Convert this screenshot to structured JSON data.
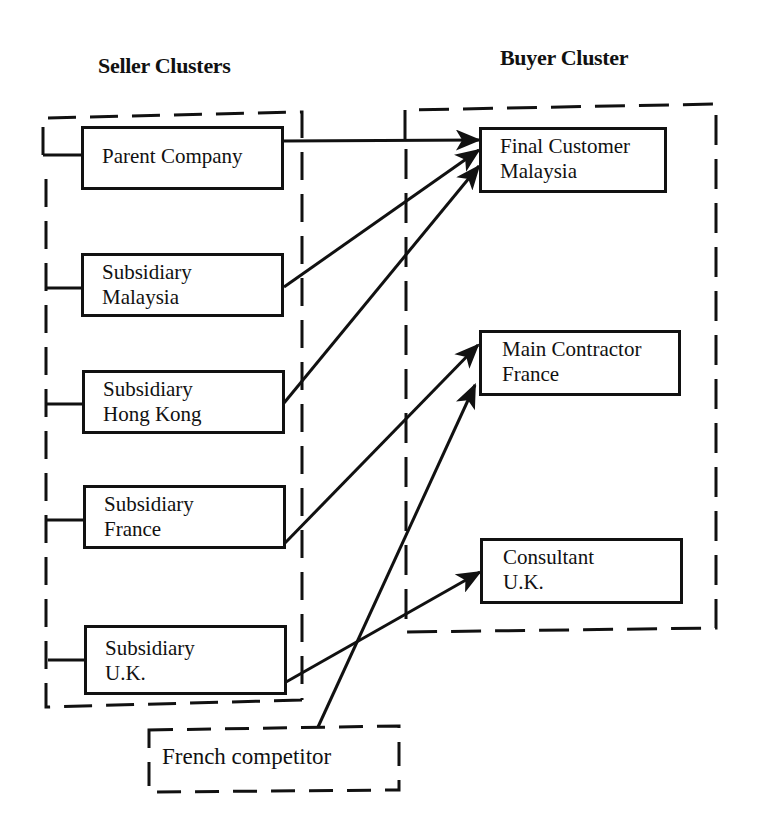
{
  "diagram": {
    "headings": {
      "seller": "Seller Clusters",
      "buyer": "Buyer Cluster"
    },
    "seller_nodes": [
      {
        "id": "parent",
        "lines": [
          "Parent Company"
        ]
      },
      {
        "id": "sub_my",
        "lines": [
          "Subsidiary",
          "Malaysia"
        ]
      },
      {
        "id": "sub_hk",
        "lines": [
          "Subsidiary",
          "Hong Kong"
        ]
      },
      {
        "id": "sub_fr",
        "lines": [
          "Subsidiary",
          "France"
        ]
      },
      {
        "id": "sub_uk",
        "lines": [
          "Subsidiary",
          "U.K."
        ]
      }
    ],
    "buyer_nodes": [
      {
        "id": "final_my",
        "lines": [
          "Final Customer",
          "Malaysia"
        ]
      },
      {
        "id": "main_fr",
        "lines": [
          "Main Contractor",
          "France"
        ]
      },
      {
        "id": "cons_uk",
        "lines": [
          "Consultant",
          "U.K."
        ]
      }
    ],
    "external": {
      "competitor": "French competitor"
    },
    "edges": [
      {
        "from": "Parent Company",
        "to": "Final Customer Malaysia"
      },
      {
        "from": "Subsidiary Malaysia",
        "to": "Final Customer Malaysia"
      },
      {
        "from": "Subsidiary Hong Kong",
        "to": "Final Customer Malaysia"
      },
      {
        "from": "Subsidiary France",
        "to": "Main Contractor France"
      },
      {
        "from": "French competitor",
        "to": "Main Contractor France"
      },
      {
        "from": "Subsidiary U.K.",
        "to": "Consultant U.K."
      }
    ],
    "colors": {
      "stroke": "#111111",
      "background": "#ffffff"
    }
  }
}
